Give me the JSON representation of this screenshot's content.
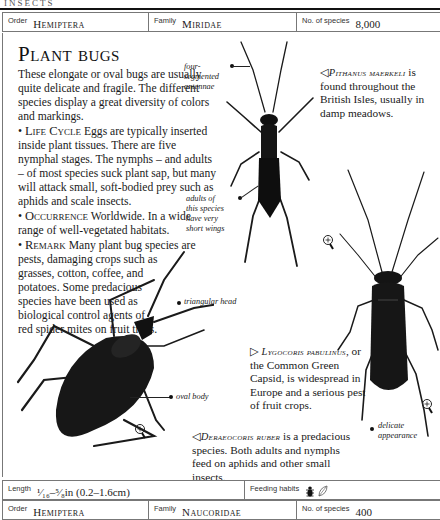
{
  "page": {
    "running_head": "INSECTS"
  },
  "header_bar": {
    "order_label": "Order",
    "order_value": "Hemiptera",
    "family_label": "Family",
    "family_value": "Miridae",
    "species_label": "No. of species",
    "species_value": "8,000"
  },
  "entry": {
    "title": "Plant bugs",
    "intro": "These elongate or oval bugs are usually quite delicate and fragile. The different species display a great diversity of colors and markings.",
    "sections": [
      {
        "bullet": "•",
        "heading": "Life Cycle",
        "text": " Eggs are typically inserted inside plant tissues. There are five nymphal stages. The nymphs – and adults – of most species suck plant sap, but many will attack small, soft-bodied prey such as aphids and scale insects."
      },
      {
        "bullet": "•",
        "heading": "Occurrence",
        "text": " Worldwide. In a wide range of well-vegetated habitats."
      },
      {
        "bullet": "•",
        "heading": "Remark",
        "text": " Many plant bug species are pests, damaging crops such as",
        "text_narrow": "grasses, cotton, coffee, and potatoes. Some predacious species have been used as biological control agents of red spider mites on fruit trees."
      }
    ]
  },
  "figures": {
    "pithanus": {
      "arrow": "◁",
      "species": "Pithanus maerkeli",
      "caption": "is found throughout the British Isles, usually in damp meadows.",
      "annotations": {
        "antennae": "four-segmented antennae",
        "wings": "adults of this species have very short wings"
      }
    },
    "deraeocoris": {
      "arrow": "◁",
      "species": "Deraeocoris ruber",
      "caption": "is a predacious species. Both adults and nymphs feed on aphids and other small insects.",
      "annotations": {
        "head": "triangular head",
        "body": "oval body"
      }
    },
    "lygocoris": {
      "arrow": "▷",
      "species_line1": "Lygocoris",
      "species_line2": "pabulinus",
      "caption_line2": ", or the",
      "caption": "Common Green Capsid, is widespread in Europe and a serious pest of fruit crops.",
      "annotations": {
        "appearance": "delicate appearance"
      }
    }
  },
  "footer_bar": {
    "length_label": "Length",
    "length_value": "¹⁄₁₆–⁵⁄₈in (0.2–1.6cm)",
    "feeding_label": "Feeding habits",
    "feeding_icons": [
      "insect-icon",
      "leaf-icon"
    ]
  },
  "next_entry_bar": {
    "order_label": "Order",
    "order_value": "Hemiptera",
    "family_label": "Family",
    "family_value": "Naucoridae",
    "species_label": "No. of species",
    "species_value": "400"
  }
}
